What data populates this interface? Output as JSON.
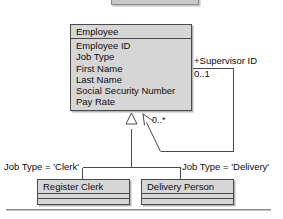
{
  "diagram": {
    "type": "uml-class-diagram",
    "background_color": "#ffffff",
    "box_fill_color": "#d6d6d6",
    "line_color": "#4a4a4a",
    "text_color": "#0d0d0d"
  },
  "classes": [
    {
      "id": "employee",
      "name": "Employee",
      "attributes": [
        "Employee ID",
        "Job Type",
        "First Name",
        "Last Name",
        "Social Security Number",
        "Pay Rate"
      ],
      "empty_compartments": 0
    },
    {
      "id": "register-clerk",
      "name": "Register Clerk",
      "attributes": [],
      "empty_compartments": 2
    },
    {
      "id": "delivery-person",
      "name": "Delivery Person",
      "attributes": [],
      "empty_compartments": 2
    }
  ],
  "association": {
    "role_label": "+Supervisor ID",
    "multiplicity_source": "0..1",
    "multiplicity_target": "0..*"
  },
  "generalization": {
    "discriminator_left": "Job Type = 'Clerk'",
    "discriminator_right": "Job Type = 'Delivery'"
  }
}
